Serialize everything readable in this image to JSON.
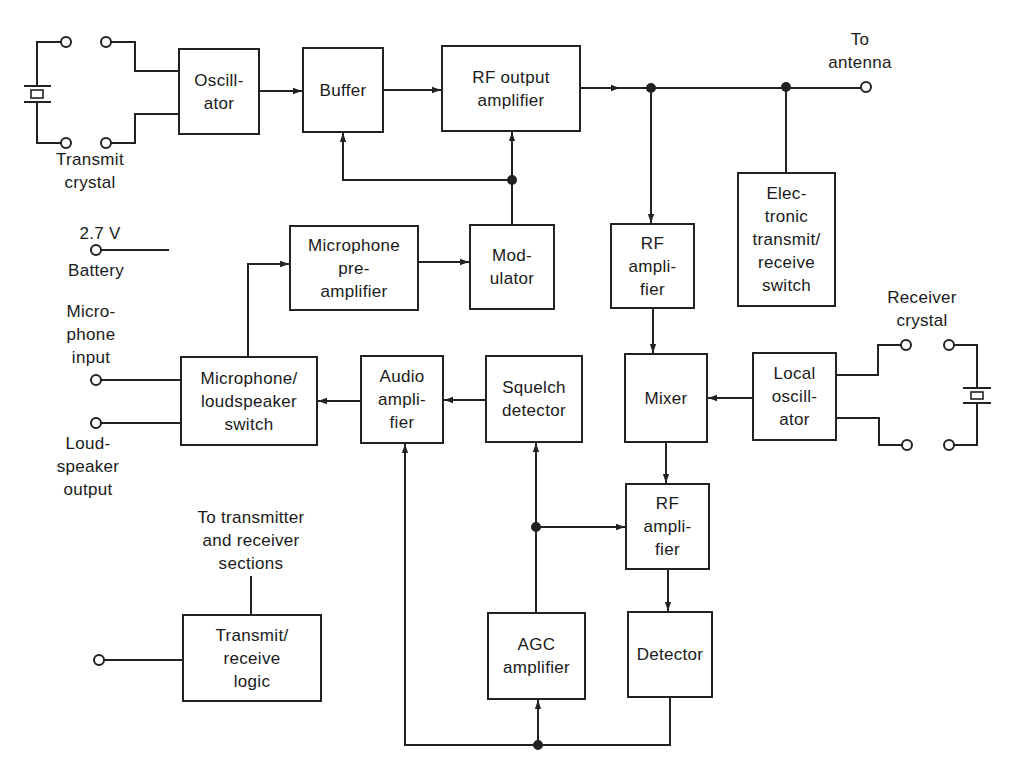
{
  "diagram": {
    "type": "block diagram",
    "colors": {
      "line": "#222222",
      "background": "#ffffff",
      "text": "#1a1a1a"
    },
    "blocks": {
      "oscillator": "Oscill-\nator",
      "buffer": "Buffer",
      "rf_output_amplifier": "RF output\namplifier",
      "electronic_tr_switch": "Elec-\ntronic\ntransmit/\nreceive\nswitch",
      "rf_amplifier_1": "RF\nampli-\nfier",
      "mic_preamp": "Microphone\npre-\namplifier",
      "modulator": "Mod-\nulator",
      "mic_ls_switch": "Microphone/\nloudspeaker\nswitch",
      "audio_amplifier": "Audio\nampli-\nfier",
      "squelch_detector": "Squelch\ndetector",
      "mixer": "Mixer",
      "local_oscillator": "Local\noscill-\nator",
      "rf_amplifier_2": "RF\nampli-\nfier",
      "agc_amplifier": "AGC\namplifier",
      "detector": "Detector",
      "tr_logic": "Transmit/\nreceive\nlogic"
    },
    "labels": {
      "transmit_crystal": "Transmit\ncrystal",
      "to_antenna": "To\nantenna",
      "battery_voltage": "2.7 V",
      "battery": "Battery",
      "microphone_input": "Micro-\nphone\ninput",
      "loudspeaker_output": "Loud-\nspeaker\noutput",
      "receiver_crystal": "Receiver\ncrystal",
      "to_sections": "To transmitter\nand receiver\nsections"
    },
    "connections": [
      {
        "from": "Transmit crystal",
        "to": "Oscillator"
      },
      {
        "from": "Oscillator",
        "to": "Buffer"
      },
      {
        "from": "Buffer",
        "to": "RF output amplifier"
      },
      {
        "from": "RF output amplifier",
        "to": "To antenna"
      },
      {
        "from": "Antenna bus",
        "to": "Electronic transmit/receive switch"
      },
      {
        "from": "Antenna bus",
        "to": "RF amplifier (1)"
      },
      {
        "from": "Modulator",
        "to": "Buffer"
      },
      {
        "from": "Modulator",
        "to": "RF output amplifier"
      },
      {
        "from": "Microphone preamplifier",
        "to": "Modulator"
      },
      {
        "from": "Microphone/loudspeaker switch",
        "to": "Microphone preamplifier"
      },
      {
        "from": "RF amplifier (1)",
        "to": "Mixer"
      },
      {
        "from": "Local oscillator",
        "to": "Mixer"
      },
      {
        "from": "Receiver crystal",
        "to": "Local oscillator"
      },
      {
        "from": "Mixer",
        "to": "RF amplifier (2)"
      },
      {
        "from": "RF amplifier (2)",
        "to": "Detector"
      },
      {
        "from": "AGC amplifier",
        "to": "Squelch detector"
      },
      {
        "from": "AGC amplifier",
        "to": "RF amplifier (2)"
      },
      {
        "from": "Detector",
        "to": "AGC amplifier"
      },
      {
        "from": "Detector",
        "to": "Audio amplifier"
      },
      {
        "from": "Squelch detector",
        "to": "Audio amplifier"
      },
      {
        "from": "Audio amplifier",
        "to": "Microphone/loudspeaker switch"
      },
      {
        "from": "Microphone input",
        "to": "Microphone/loudspeaker switch"
      },
      {
        "from": "Microphone/loudspeaker switch",
        "to": "Loudspeaker output"
      },
      {
        "from": "Input terminal",
        "to": "Transmit/receive logic"
      },
      {
        "from": "Transmit/receive logic",
        "to": "To transmitter and receiver sections"
      }
    ]
  }
}
